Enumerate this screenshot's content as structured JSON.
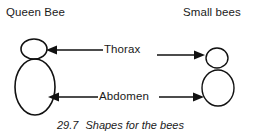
{
  "figure": {
    "caption_number": "29.7",
    "caption_text": "Shapes for the bees",
    "background_color": "#ffffff",
    "ink_color": "#111111"
  },
  "headings": {
    "left": "Queen Bee",
    "right": "Small bees"
  },
  "callouts": [
    {
      "label": "Thorax",
      "left_arrow_direction": "left",
      "right_arrow_direction": "right"
    },
    {
      "label": "Abdomen",
      "left_arrow_direction": "left",
      "right_arrow_direction": "right"
    }
  ],
  "labels": {
    "thorax": "Thorax",
    "abdomen": "Abdomen"
  },
  "bees": {
    "queen": {
      "name": "Queen Bee",
      "thorax": {
        "shape": "ellipse",
        "cx": 34,
        "cy": 49,
        "rx": 13,
        "ry": 10
      },
      "abdomen": {
        "shape": "ellipse",
        "cx": 35,
        "cy": 87,
        "rx": 20,
        "ry": 28
      }
    },
    "small": {
      "name": "Small bees",
      "thorax": {
        "shape": "ellipse",
        "cx": 217,
        "cy": 58,
        "rx": 11,
        "ry": 10
      },
      "abdomen": {
        "shape": "ellipse",
        "cx": 218,
        "cy": 88,
        "rx": 16,
        "ry": 18
      }
    }
  }
}
